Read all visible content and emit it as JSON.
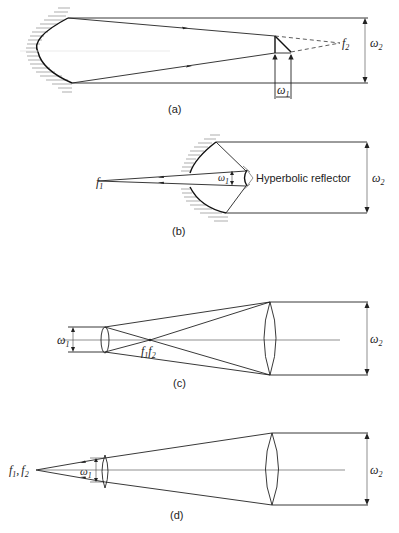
{
  "figure": {
    "panels": [
      {
        "id": "a",
        "caption": "(a)",
        "labels": {
          "focus": "f",
          "focus_sub": "2",
          "input_width": "ω",
          "input_width_sub": "1",
          "output_width": "ω",
          "output_width_sub": "2"
        }
      },
      {
        "id": "b",
        "caption": "(b)",
        "labels": {
          "focus": "f",
          "focus_sub": "1",
          "input_width": "ω",
          "input_width_sub": "1",
          "output_width": "ω",
          "output_width_sub": "2",
          "reflector": "Hyperbolic reflector"
        }
      },
      {
        "id": "c",
        "caption": "(c)",
        "labels": {
          "focus": "f",
          "focus_sub": "1",
          "focus2": "f",
          "focus2_sub": "2",
          "input_width": "ω",
          "input_width_sub": "1",
          "output_width": "ω",
          "output_width_sub": "2"
        }
      },
      {
        "id": "d",
        "caption": "(d)",
        "labels": {
          "focus": "f",
          "focus_sub": "1",
          "sep": ",",
          "focus2": "f",
          "focus2_sub": "2",
          "input_width": "ω",
          "input_width_sub": "1",
          "output_width": "ω",
          "output_width_sub": "2"
        }
      }
    ]
  }
}
